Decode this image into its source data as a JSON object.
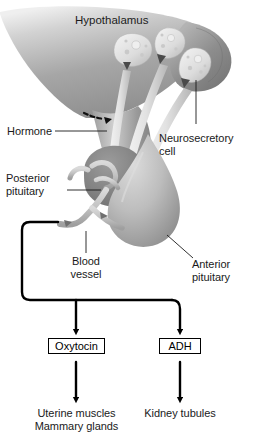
{
  "figure": {
    "title_label": "Hypothalamus",
    "anatomy_labels": [
      {
        "id": "hormone",
        "text": "Hormone",
        "lines": [
          "Hormone"
        ]
      },
      {
        "id": "neurosecretory-cell",
        "text": "Neurosecretory cell",
        "lines": [
          "Neurosecretory",
          "cell"
        ]
      },
      {
        "id": "posterior-pituitary",
        "text": "Posterior pituitary",
        "lines": [
          "Posterior",
          "pituitary"
        ]
      },
      {
        "id": "blood-vessel",
        "text": "Blood vessel",
        "lines": [
          "Blood",
          "vessel"
        ]
      },
      {
        "id": "anterior-pituitary",
        "text": "Anterior pituitary",
        "lines": [
          "Anterior",
          "pituitary"
        ]
      }
    ],
    "hormone_boxes": [
      {
        "id": "oxytocin",
        "label": "Oxytocin"
      },
      {
        "id": "adh",
        "label": "ADH"
      }
    ],
    "target_tissues": [
      {
        "id": "oxytocin-targets",
        "lines": [
          "Uterine muscles",
          "Mammary glands"
        ]
      },
      {
        "id": "adh-targets",
        "lines": [
          "Kidney tubules"
        ]
      }
    ],
    "colors": {
      "background": "#ffffff",
      "text": "#1a1a1a",
      "flow_line": "#000000",
      "hypothalamus_light": "#e8e8e8",
      "hypothalamus_mid": "#a9a9a9",
      "hypothalamus_dark": "#8f8f8f",
      "posterior_pituitary": "#8a8a8a",
      "anterior_pituitary": "#bdbdbd",
      "neuron_body": "#e2e2e2",
      "vessel": "#c6c6c6"
    }
  }
}
